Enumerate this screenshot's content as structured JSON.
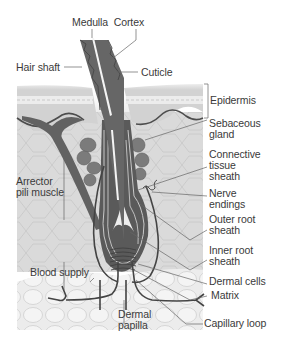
{
  "diagram": {
    "colors": {
      "background": "#ffffff",
      "epidermis": "#d4d4d4",
      "epidermis_band": "#e6e6e6",
      "dermis": "#d9d9d9",
      "cell_lines": "#c4c4c4",
      "fat_layer": "#ececec",
      "hair": "#6a6a6a",
      "hair_dark": "#4f4f4f",
      "medulla": "#f2f2f2",
      "gland": "#7a7a7a",
      "vessel": "#4a4a4a",
      "leader": "#555555",
      "text": "#3a3a3a"
    },
    "labels": {
      "medulla_cortex": "Medulla  Cortex",
      "hair_shaft": "Hair shaft",
      "cuticle": "Cuticle",
      "epidermis": "Epidermis",
      "sebaceous_gland": "Sebaceous\ngland",
      "connective_tissue_sheath": "Connective\ntissue\nsheath",
      "arrector_pili_muscle": "Arrector\npili muscle",
      "nerve_endings": "Nerve\nendings",
      "outer_root_sheath": "Outer root\nsheath",
      "inner_root_sheath": "Inner root\nsheath",
      "blood_supply": "Blood supply",
      "dermal_cells": "Dermal cells",
      "matrix": "Matrix",
      "dermal_papilla": "Dermal\npapilla",
      "capillary_loop": "Capillary loop"
    }
  }
}
